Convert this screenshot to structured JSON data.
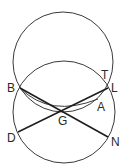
{
  "figure": {
    "type": "geometry-diagram",
    "circles": [
      {
        "name": "upper-circle",
        "cx": 63,
        "cy": 62,
        "r": 50
      },
      {
        "name": "lower-circle",
        "cx": 64,
        "cy": 112,
        "r": 51
      }
    ],
    "points": {
      "B": {
        "x": 20,
        "y": 88
      },
      "T": {
        "x": 104,
        "y": 80
      },
      "L": {
        "x": 108,
        "y": 88
      },
      "A": {
        "x": 98,
        "y": 99
      },
      "G": {
        "x": 62,
        "y": 111
      },
      "D": {
        "x": 18,
        "y": 132
      },
      "N": {
        "x": 108,
        "y": 137
      }
    },
    "labels": [
      {
        "text": "B",
        "x": 7,
        "y": 92
      },
      {
        "text": "T",
        "x": 101,
        "y": 79
      },
      {
        "text": "L",
        "x": 111,
        "y": 92
      },
      {
        "text": "A",
        "x": 97,
        "y": 111
      },
      {
        "text": "G",
        "x": 58,
        "y": 125
      },
      {
        "text": "D",
        "x": 7,
        "y": 142
      },
      {
        "text": "N",
        "x": 111,
        "y": 146
      }
    ],
    "colors": {
      "line": "#1e1e1e",
      "circle": "#3a3a3a",
      "background": "#ffffff"
    }
  }
}
